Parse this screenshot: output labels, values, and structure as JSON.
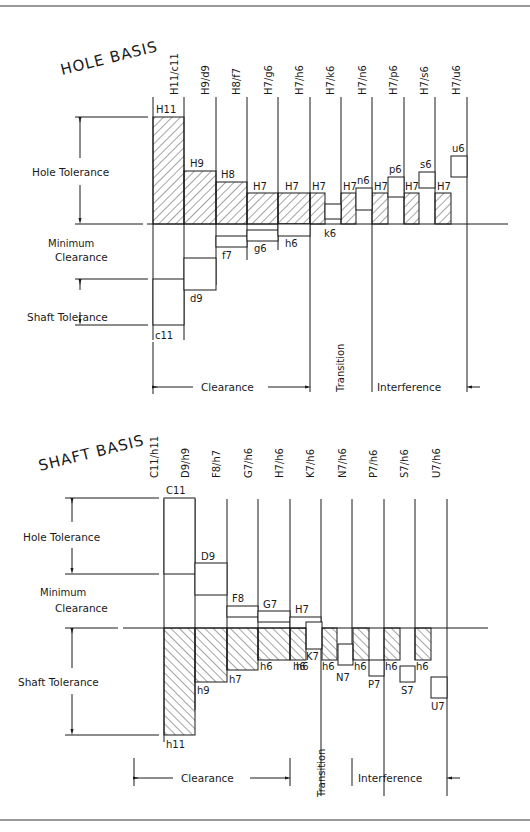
{
  "colors": {
    "line": "#1a1a1a",
    "frame": "#777777",
    "background": "#ffffff"
  },
  "hole_basis": {
    "title": "HOLE BASIS",
    "columns": [
      "H11/c11",
      "H9/d9",
      "H8/f7",
      "H7/g6",
      "H7/h6",
      "H7/k6",
      "H7/n6",
      "H7/p6",
      "H7/s6",
      "H7/u6"
    ],
    "hole_labels": [
      "H11",
      "H9",
      "H8",
      "H7",
      "H7",
      "H7",
      "H7",
      "H7",
      "H7",
      "H7"
    ],
    "shaft_labels": [
      "c11",
      "d9",
      "f7",
      "g6",
      "h6",
      "k6",
      "n6",
      "p6",
      "s6",
      "u6"
    ],
    "left_labels": {
      "hole_tolerance": "Hole Tolerance",
      "minimum": "Minimum",
      "clearance": "Clearance",
      "shaft_tolerance": "Shaft Tolerance"
    },
    "ranges": {
      "clearance": "Clearance",
      "transition": "Transition",
      "interference": "Interference"
    }
  },
  "shaft_basis": {
    "title": "SHAFT BASIS",
    "columns": [
      "C11/h11",
      "D9/h9",
      "F8/h7",
      "G7/h6",
      "H7/h6",
      "K7/h6",
      "N7/h6",
      "P7/h6",
      "S7/h6",
      "U7/h6"
    ],
    "hole_labels": [
      "C11",
      "D9",
      "F8",
      "G7",
      "H7",
      "K7",
      "N7",
      "P7",
      "S7",
      "U7"
    ],
    "shaft_labels": [
      "h11",
      "h9",
      "h7",
      "h6",
      "h6",
      "h6",
      "h6",
      "h6",
      "h6",
      "h6"
    ],
    "left_labels": {
      "hole_tolerance": "Hole Tolerance",
      "minimum": "Minimum",
      "clearance": "Clearance",
      "shaft_tolerance": "Shaft Tolerance"
    },
    "ranges": {
      "clearance": "Clearance",
      "transition": "Transition",
      "interference": "Interference"
    }
  }
}
